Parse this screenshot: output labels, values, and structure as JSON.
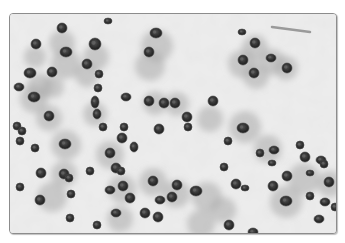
{
  "image": {
    "subject": "histology micrograph, grayscale",
    "description": "Cells with dark round nuclei surrounded by grey cytoplasm on a pale mottled background",
    "frame": {
      "x": 9,
      "y": 13,
      "width": 326,
      "height": 219,
      "border_color": "#8c8c8c",
      "corner_radius": 4
    },
    "colors": {
      "background": "#e8e8e8",
      "background_light": "#f4f4f4",
      "cytoplasm": "#a9a9a9",
      "nucleus": "#2e2e2e",
      "nucleus_rim": "#4a4a4a",
      "chromatin": "#6a6a6a"
    },
    "cells": [
      {
        "x": 52,
        "y": 29,
        "r": 13
      },
      {
        "x": 25,
        "y": 43,
        "r": 11
      },
      {
        "x": 56,
        "y": 50,
        "r": 15
      },
      {
        "x": 86,
        "y": 43,
        "r": 13
      },
      {
        "x": 77,
        "y": 61,
        "r": 12
      },
      {
        "x": 30,
        "y": 72,
        "r": 13
      },
      {
        "x": 43,
        "y": 73,
        "r": 11
      },
      {
        "x": 147,
        "y": 32,
        "r": 16
      },
      {
        "x": 140,
        "y": 52,
        "r": 15
      },
      {
        "x": 245,
        "y": 34,
        "r": 13
      },
      {
        "x": 232,
        "y": 50,
        "r": 14
      },
      {
        "x": 262,
        "y": 48,
        "r": 13
      },
      {
        "x": 276,
        "y": 54,
        "r": 12
      },
      {
        "x": 246,
        "y": 62,
        "r": 13
      },
      {
        "x": 24,
        "y": 85,
        "r": 14
      },
      {
        "x": 39,
        "y": 104,
        "r": 13
      },
      {
        "x": 85,
        "y": 100,
        "r": 12
      },
      {
        "x": 56,
        "y": 131,
        "r": 15
      },
      {
        "x": 145,
        "y": 89,
        "r": 12
      },
      {
        "x": 167,
        "y": 90,
        "r": 12
      },
      {
        "x": 200,
        "y": 105,
        "r": 13
      },
      {
        "x": 235,
        "y": 113,
        "r": 16
      },
      {
        "x": 294,
        "y": 165,
        "r": 16
      },
      {
        "x": 320,
        "y": 170,
        "r": 13
      },
      {
        "x": 54,
        "y": 160,
        "r": 13
      },
      {
        "x": 100,
        "y": 141,
        "r": 14
      },
      {
        "x": 42,
        "y": 183,
        "r": 15
      },
      {
        "x": 112,
        "y": 175,
        "r": 14
      },
      {
        "x": 143,
        "y": 168,
        "r": 14
      },
      {
        "x": 166,
        "y": 180,
        "r": 14
      },
      {
        "x": 197,
        "y": 183,
        "r": 15
      },
      {
        "x": 276,
        "y": 188,
        "r": 16
      },
      {
        "x": 110,
        "y": 205,
        "r": 13
      },
      {
        "x": 191,
        "y": 210,
        "r": 14
      },
      {
        "x": 258,
        "y": 135,
        "r": 14
      },
      {
        "x": 213,
        "y": 196,
        "r": 13
      }
    ],
    "nuclei": [
      {
        "x": 52,
        "y": 14,
        "rx": 5,
        "ry": 5
      },
      {
        "x": 98,
        "y": 7,
        "rx": 4,
        "ry": 3
      },
      {
        "x": 26,
        "y": 30,
        "rx": 5,
        "ry": 5
      },
      {
        "x": 56,
        "y": 38,
        "rx": 6,
        "ry": 5
      },
      {
        "x": 85,
        "y": 30,
        "rx": 6,
        "ry": 6
      },
      {
        "x": 77,
        "y": 50,
        "rx": 5,
        "ry": 5
      },
      {
        "x": 20,
        "y": 59,
        "rx": 6,
        "ry": 5
      },
      {
        "x": 42,
        "y": 58,
        "rx": 5,
        "ry": 5
      },
      {
        "x": 89,
        "y": 60,
        "rx": 4,
        "ry": 4
      },
      {
        "x": 9,
        "y": 73,
        "rx": 5,
        "ry": 4
      },
      {
        "x": 88,
        "y": 74,
        "rx": 4,
        "ry": 4
      },
      {
        "x": 146,
        "y": 19,
        "rx": 6,
        "ry": 5
      },
      {
        "x": 139,
        "y": 38,
        "rx": 5,
        "ry": 5
      },
      {
        "x": 232,
        "y": 18,
        "rx": 4,
        "ry": 3
      },
      {
        "x": 245,
        "y": 29,
        "rx": 5,
        "ry": 5
      },
      {
        "x": 233,
        "y": 46,
        "rx": 5,
        "ry": 5
      },
      {
        "x": 261,
        "y": 44,
        "rx": 5,
        "ry": 4
      },
      {
        "x": 277,
        "y": 54,
        "rx": 5,
        "ry": 5
      },
      {
        "x": 244,
        "y": 59,
        "rx": 5,
        "ry": 5
      },
      {
        "x": 24,
        "y": 83,
        "rx": 6,
        "ry": 5
      },
      {
        "x": 7,
        "y": 112,
        "rx": 4,
        "ry": 4
      },
      {
        "x": 12,
        "y": 117,
        "rx": 4,
        "ry": 4
      },
      {
        "x": 39,
        "y": 102,
        "rx": 5,
        "ry": 5
      },
      {
        "x": 85,
        "y": 88,
        "rx": 4,
        "ry": 6
      },
      {
        "x": 87,
        "y": 100,
        "rx": 4,
        "ry": 5
      },
      {
        "x": 93,
        "y": 113,
        "rx": 4,
        "ry": 4
      },
      {
        "x": 25,
        "y": 134,
        "rx": 4,
        "ry": 4
      },
      {
        "x": 55,
        "y": 130,
        "rx": 6,
        "ry": 5
      },
      {
        "x": 80,
        "y": 157,
        "rx": 4,
        "ry": 4
      },
      {
        "x": 100,
        "y": 139,
        "rx": 5,
        "ry": 5
      },
      {
        "x": 112,
        "y": 124,
        "rx": 5,
        "ry": 5
      },
      {
        "x": 114,
        "y": 113,
        "rx": 4,
        "ry": 4
      },
      {
        "x": 116,
        "y": 83,
        "rx": 5,
        "ry": 4
      },
      {
        "x": 139,
        "y": 87,
        "rx": 5,
        "ry": 5
      },
      {
        "x": 154,
        "y": 89,
        "rx": 5,
        "ry": 5
      },
      {
        "x": 165,
        "y": 89,
        "rx": 5,
        "ry": 5
      },
      {
        "x": 177,
        "y": 103,
        "rx": 5,
        "ry": 5
      },
      {
        "x": 178,
        "y": 113,
        "rx": 4,
        "ry": 4
      },
      {
        "x": 203,
        "y": 87,
        "rx": 5,
        "ry": 5
      },
      {
        "x": 124,
        "y": 133,
        "rx": 4,
        "ry": 5
      },
      {
        "x": 106,
        "y": 154,
        "rx": 5,
        "ry": 5
      },
      {
        "x": 111,
        "y": 157,
        "rx": 4,
        "ry": 4
      },
      {
        "x": 149,
        "y": 115,
        "rx": 5,
        "ry": 5
      },
      {
        "x": 218,
        "y": 127,
        "rx": 4,
        "ry": 4
      },
      {
        "x": 233,
        "y": 114,
        "rx": 6,
        "ry": 5
      },
      {
        "x": 10,
        "y": 127,
        "rx": 4,
        "ry": 4
      },
      {
        "x": 214,
        "y": 153,
        "rx": 4,
        "ry": 4
      },
      {
        "x": 250,
        "y": 139,
        "rx": 4,
        "ry": 4
      },
      {
        "x": 262,
        "y": 149,
        "rx": 4,
        "ry": 3
      },
      {
        "x": 264,
        "y": 136,
        "rx": 5,
        "ry": 4
      },
      {
        "x": 290,
        "y": 131,
        "rx": 4,
        "ry": 4
      },
      {
        "x": 295,
        "y": 143,
        "rx": 5,
        "ry": 5
      },
      {
        "x": 311,
        "y": 146,
        "rx": 5,
        "ry": 4
      },
      {
        "x": 300,
        "y": 159,
        "rx": 4,
        "ry": 3
      },
      {
        "x": 277,
        "y": 162,
        "rx": 5,
        "ry": 5
      },
      {
        "x": 314,
        "y": 150,
        "rx": 4,
        "ry": 4
      },
      {
        "x": 319,
        "y": 168,
        "rx": 5,
        "ry": 5
      },
      {
        "x": 10,
        "y": 173,
        "rx": 4,
        "ry": 4
      },
      {
        "x": 31,
        "y": 159,
        "rx": 5,
        "ry": 5
      },
      {
        "x": 54,
        "y": 160,
        "rx": 5,
        "ry": 5
      },
      {
        "x": 59,
        "y": 164,
        "rx": 4,
        "ry": 4
      },
      {
        "x": 30,
        "y": 186,
        "rx": 5,
        "ry": 5
      },
      {
        "x": 61,
        "y": 180,
        "rx": 4,
        "ry": 4
      },
      {
        "x": 100,
        "y": 176,
        "rx": 5,
        "ry": 4
      },
      {
        "x": 106,
        "y": 199,
        "rx": 5,
        "ry": 4
      },
      {
        "x": 60,
        "y": 204,
        "rx": 4,
        "ry": 4
      },
      {
        "x": 87,
        "y": 211,
        "rx": 4,
        "ry": 4
      },
      {
        "x": 113,
        "y": 172,
        "rx": 5,
        "ry": 5
      },
      {
        "x": 120,
        "y": 184,
        "rx": 5,
        "ry": 5
      },
      {
        "x": 135,
        "y": 199,
        "rx": 5,
        "ry": 5
      },
      {
        "x": 143,
        "y": 167,
        "rx": 5,
        "ry": 5
      },
      {
        "x": 148,
        "y": 203,
        "rx": 5,
        "ry": 5
      },
      {
        "x": 150,
        "y": 186,
        "rx": 5,
        "ry": 4
      },
      {
        "x": 162,
        "y": 183,
        "rx": 5,
        "ry": 5
      },
      {
        "x": 167,
        "y": 171,
        "rx": 5,
        "ry": 5
      },
      {
        "x": 186,
        "y": 177,
        "rx": 6,
        "ry": 5
      },
      {
        "x": 226,
        "y": 170,
        "rx": 5,
        "ry": 5
      },
      {
        "x": 243,
        "y": 218,
        "rx": 5,
        "ry": 4
      },
      {
        "x": 263,
        "y": 172,
        "rx": 5,
        "ry": 5
      },
      {
        "x": 276,
        "y": 187,
        "rx": 6,
        "ry": 5
      },
      {
        "x": 219,
        "y": 211,
        "rx": 5,
        "ry": 5
      },
      {
        "x": 235,
        "y": 174,
        "rx": 4,
        "ry": 3
      },
      {
        "x": 300,
        "y": 182,
        "rx": 4,
        "ry": 4
      },
      {
        "x": 315,
        "y": 188,
        "rx": 5,
        "ry": 4
      },
      {
        "x": 325,
        "y": 193,
        "rx": 4,
        "ry": 4
      },
      {
        "x": 309,
        "y": 205,
        "rx": 5,
        "ry": 4
      }
    ],
    "fibers": [
      {
        "x1": 262,
        "y1": 13,
        "x2": 300,
        "y2": 18
      }
    ]
  }
}
